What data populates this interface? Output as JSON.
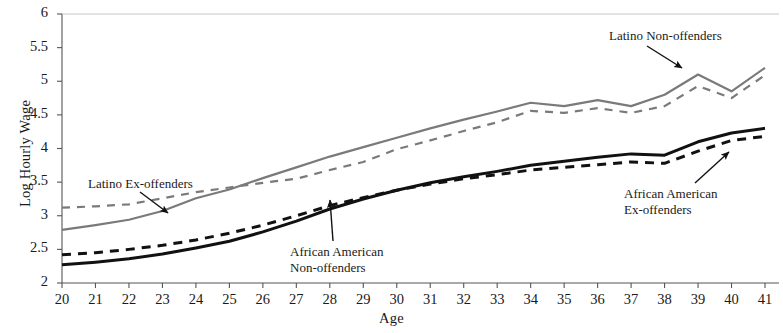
{
  "chart_data": {
    "type": "line",
    "title": "",
    "xlabel": "Age",
    "ylabel": "Log Hourly Wage",
    "xlim": [
      20,
      41
    ],
    "ylim": [
      2,
      6
    ],
    "grid": false,
    "legend_position": "inline-annotations",
    "x": [
      20,
      21,
      22,
      23,
      24,
      25,
      26,
      27,
      28,
      29,
      30,
      31,
      32,
      33,
      34,
      35,
      36,
      37,
      38,
      39,
      40,
      41
    ],
    "xticks": [
      "20",
      "21",
      "22",
      "23",
      "24",
      "25",
      "26",
      "27",
      "28",
      "29",
      "30",
      "31",
      "32",
      "33",
      "34",
      "35",
      "36",
      "37",
      "38",
      "39",
      "40",
      "41"
    ],
    "yticks": [
      "2",
      "2.5",
      "3",
      "3.5",
      "4",
      "4.5",
      "5",
      "5.5",
      "6"
    ],
    "series": [
      {
        "name": "Latino Non-offenders",
        "style": "solid",
        "color": "#7a7a7a",
        "values": [
          2.79,
          2.86,
          2.94,
          3.07,
          3.26,
          3.39,
          3.56,
          3.72,
          3.88,
          4.02,
          4.16,
          4.3,
          4.43,
          4.55,
          4.68,
          4.63,
          4.72,
          4.63,
          4.8,
          5.1,
          4.85,
          5.2
        ]
      },
      {
        "name": "Latino Ex-offenders",
        "style": "dashed",
        "color": "#7a7a7a",
        "values": [
          3.12,
          3.14,
          3.17,
          3.26,
          3.35,
          3.42,
          3.49,
          3.55,
          3.68,
          3.8,
          3.99,
          4.12,
          4.26,
          4.39,
          4.56,
          4.53,
          4.6,
          4.53,
          4.63,
          4.93,
          4.75,
          5.09
        ]
      },
      {
        "name": "African American Non-offenders",
        "style": "solid",
        "color": "#111111",
        "values": [
          2.27,
          2.31,
          2.36,
          2.43,
          2.52,
          2.62,
          2.76,
          2.92,
          3.1,
          3.25,
          3.38,
          3.49,
          3.58,
          3.66,
          3.75,
          3.81,
          3.87,
          3.92,
          3.9,
          4.1,
          4.23,
          4.3
        ]
      },
      {
        "name": "African American Ex-offenders",
        "style": "dashed",
        "color": "#111111",
        "values": [
          2.42,
          2.45,
          2.5,
          2.56,
          2.64,
          2.74,
          2.86,
          3.0,
          3.15,
          3.27,
          3.38,
          3.47,
          3.55,
          3.61,
          3.68,
          3.72,
          3.76,
          3.8,
          3.78,
          3.96,
          4.12,
          4.18
        ]
      }
    ],
    "annotations": [
      {
        "id": "latino-ex-offenders",
        "text": "Latino Ex-offenders",
        "label_x": 88,
        "label_y": 176,
        "arrow_from_x": 140,
        "arrow_from_y": 192,
        "arrow_to_x": 168,
        "arrow_to_y": 213
      },
      {
        "id": "latino-non-offenders",
        "text": "Latino Non-offenders",
        "label_x": 609,
        "label_y": 28,
        "arrow_from_x": 647,
        "arrow_from_y": 46,
        "arrow_to_x": 682,
        "arrow_to_y": 68
      },
      {
        "id": "african-american-non-offenders",
        "text": "African American\nNon-offenders",
        "label_x": 290,
        "label_y": 244,
        "arrow_from_x": 333,
        "arrow_from_y": 241,
        "arrow_to_x": 330,
        "arrow_to_y": 200
      },
      {
        "id": "african-american-ex-offenders",
        "text": "African American\nEx-offenders",
        "label_x": 624,
        "label_y": 186,
        "arrow_from_x": 695,
        "arrow_from_y": 183,
        "arrow_to_x": 729,
        "arrow_to_y": 152
      }
    ]
  },
  "axis": {
    "x_title": "Age",
    "y_title": "Log Hourly Wage"
  },
  "colors": {
    "latino": "#7a7a7a",
    "african_american": "#111111",
    "axis": "#555555",
    "top_border": "#b8b8b8"
  }
}
